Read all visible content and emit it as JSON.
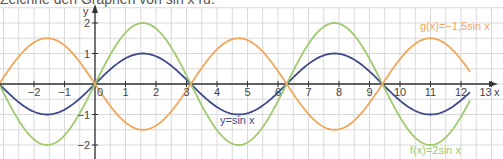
{
  "title": "Zeichne den Graphen von sin x ru.",
  "chart_data": {
    "type": "line",
    "title": "Zeichne den Graphen von sin x",
    "xlabel": "x",
    "ylabel": "y",
    "xlim": [
      -3.1,
      13.2
    ],
    "ylim": [
      -2.5,
      2.7
    ],
    "grid": true,
    "x_ticks": [
      -2,
      -1,
      0,
      1,
      2,
      3,
      4,
      5,
      6,
      7,
      8,
      9,
      10,
      11,
      12,
      13
    ],
    "y_ticks": [
      -2,
      -1,
      1,
      2
    ],
    "series": [
      {
        "name": "y = sin x",
        "label": "y=sin x",
        "amplitude": 1,
        "color": "#3d4a8a"
      },
      {
        "name": "f(x) = 2 sin x",
        "label": "f(x)=2sin x",
        "amplitude": 2,
        "color": "#9fca6e"
      },
      {
        "name": "g(x) = -1,5 sin x",
        "label": "g(x)=−1,5sin x",
        "amplitude": -1.5,
        "color": "#f2a65a"
      }
    ]
  },
  "labels": {
    "x_axis": "x",
    "y_axis": "y",
    "sin": "y=sin x",
    "f": "f(x)=2sin x",
    "g": "g(x)=−1,5sin x"
  },
  "colors": {
    "grid": "#d9d9d9",
    "axis": "#333333"
  }
}
